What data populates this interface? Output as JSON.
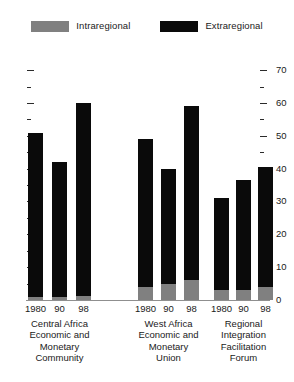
{
  "legend": {
    "items": [
      {
        "label": "Intraregional",
        "color": "#808080",
        "key": "intraregional"
      },
      {
        "label": "Extraregional",
        "color": "#0a0a0a",
        "key": "extraregional"
      }
    ]
  },
  "axis": {
    "y_ticks_major": [
      "0",
      "10",
      "20",
      "30",
      "40",
      "50",
      "60",
      "70"
    ],
    "y_min": 0,
    "y_max": 74,
    "minor_step": 5
  },
  "chart_data": {
    "type": "bar",
    "title": "",
    "subtitle": "",
    "xlabel": "",
    "ylabel": "",
    "ylim": [
      0,
      74
    ],
    "grid": false,
    "stacked": true,
    "legend_position": "top",
    "legend_entries": [
      "Intraregional",
      "Extraregional"
    ],
    "x": [
      "1980",
      "90",
      "98"
    ],
    "groups": [
      {
        "name": "Central Africa Economic and Monetary Community",
        "name_lines": "Central Africa\nEconomic and\nMonetary\nCommunity",
        "categories": [
          "1980",
          "90",
          "98"
        ],
        "series": [
          {
            "name": "Intraregional",
            "values": [
              1.0,
              1.0,
              1.2
            ]
          },
          {
            "name": "Extraregional",
            "values": [
              50.0,
              41.0,
              58.8
            ]
          }
        ],
        "totals": [
          51.0,
          42.0,
          60.0
        ]
      },
      {
        "name": "West Africa Economic and Monetary Union",
        "name_lines": "West Africa\nEconomic and\nMonetary\nUnion",
        "categories": [
          "1980",
          "90",
          "98"
        ],
        "series": [
          {
            "name": "Intraregional",
            "values": [
              4.0,
              5.0,
              6.0
            ]
          },
          {
            "name": "Extraregional",
            "values": [
              45.0,
              35.0,
              53.0
            ]
          }
        ],
        "totals": [
          49.0,
          40.0,
          59.0
        ]
      },
      {
        "name": "Regional Integration Facilitation Forum",
        "name_lines": "Regional\nIntegration\nFacilitation\nForum",
        "categories": [
          "1980",
          "90",
          "98"
        ],
        "series": [
          {
            "name": "Intraregional",
            "values": [
              3.0,
              3.2,
              4.0
            ]
          },
          {
            "name": "Extraregional",
            "values": [
              28.0,
              33.3,
              36.5
            ]
          }
        ],
        "totals": [
          31.0,
          36.5,
          40.5
        ]
      }
    ]
  }
}
